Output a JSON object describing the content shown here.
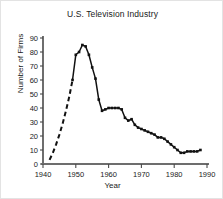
{
  "chart_data": {
    "type": "line",
    "title": "U.S. Television Industry",
    "xlabel": "Year",
    "ylabel": "Number of Firms",
    "xlim": [
      1940,
      1990
    ],
    "ylim": [
      0,
      90
    ],
    "xticks": [
      1940,
      1950,
      1960,
      1970,
      1980,
      1990
    ],
    "yticks": [
      0,
      10,
      20,
      30,
      40,
      50,
      60,
      70,
      80,
      90
    ],
    "grid": false,
    "legend": "none",
    "series": [
      {
        "name": "Number of Firms (estimated / dashed)",
        "style": "dashed",
        "markers": false,
        "x": [
          1942,
          1943,
          1944,
          1945,
          1946,
          1947,
          1948,
          1949
        ],
        "values": [
          3,
          8,
          14,
          21,
          29,
          38,
          48,
          60
        ]
      },
      {
        "name": "Number of Firms (observed / solid)",
        "style": "solid",
        "markers": true,
        "x": [
          1949,
          1950,
          1951,
          1952,
          1953,
          1954,
          1955,
          1956,
          1957,
          1958,
          1959,
          1960,
          1961,
          1962,
          1963,
          1964,
          1965,
          1966,
          1967,
          1968,
          1969,
          1970,
          1971,
          1972,
          1973,
          1974,
          1975,
          1976,
          1977,
          1978,
          1979,
          1980,
          1981,
          1982,
          1983,
          1984,
          1985,
          1986,
          1987,
          1988
        ],
        "values": [
          60,
          78,
          80,
          85,
          84,
          78,
          69,
          61,
          46,
          38,
          39,
          40,
          40,
          40,
          40,
          39,
          33,
          31,
          32,
          28,
          26,
          25,
          24,
          23,
          22,
          21,
          19,
          19,
          18,
          16,
          14,
          12,
          10,
          8,
          8,
          9,
          9,
          9,
          9,
          10
        ]
      }
    ]
  }
}
